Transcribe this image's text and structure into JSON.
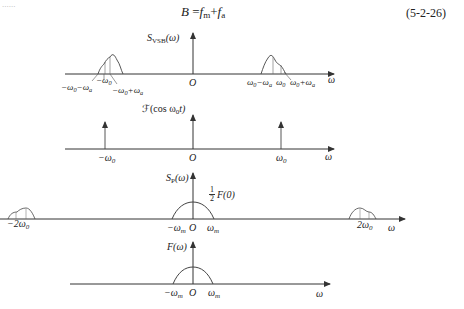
{
  "header": {
    "top_fragment": "......",
    "equation": "B = f_m + f_a",
    "equation_parts": {
      "lhs": "B",
      "eq": "=",
      "t1": "f",
      "t1_sub": "m",
      "plus": "+",
      "t2": "f",
      "t2_sub": "a"
    },
    "equation_number": "(5-2-26)"
  },
  "panels": [
    {
      "id": "vsb",
      "y_label": "S",
      "y_label_sub": "VSB",
      "y_label_arg": "(ω)",
      "origin": "O",
      "x_label": "ω",
      "ticks_left": {
        "a": "−ω",
        "a_sub": "0",
        "a2": "−ω",
        "a2_sub": "a",
        "b": "−ω",
        "b_sub": "0",
        "c": "−ω",
        "c_sub": "0",
        "c2": "+ω",
        "c2_sub": "a"
      },
      "ticks_right": {
        "a": "ω",
        "a_sub": "0",
        "a2": "−ω",
        "a2_sub": "a",
        "b": "ω",
        "b_sub": "0",
        "c": "ω",
        "c_sub": "0",
        "c2": "+ω",
        "c2_sub": "a"
      }
    },
    {
      "id": "carrier",
      "y_label": "ℱ(cos ω",
      "y_label_sub": "0",
      "y_label_arg": "t)",
      "origin": "O",
      "x_label": "ω",
      "tick_left": "−ω",
      "tick_left_sub": "0",
      "tick_right": "ω",
      "tick_right_sub": "0"
    },
    {
      "id": "product",
      "y_label": "S",
      "y_label_sub": "P",
      "y_label_arg": "(ω)",
      "peak_label_num": "1",
      "peak_label_den": "2",
      "peak_label": "F(0)",
      "origin": "O",
      "x_label": "ω",
      "tick_neg_m": "−ω",
      "tick_neg_m_sub": "m",
      "tick_pos_m": "ω",
      "tick_pos_m_sub": "m",
      "tick_neg_2w0": "−2ω",
      "tick_neg_2w0_sub": "0",
      "tick_pos_2w0": "2ω",
      "tick_pos_2w0_sub": "0"
    },
    {
      "id": "baseband",
      "y_label": "F(ω)",
      "origin": "O",
      "x_label": "ω",
      "tick_neg_m": "−ω",
      "tick_neg_m_sub": "m",
      "tick_pos_m": "ω",
      "tick_pos_m_sub": "m"
    }
  ],
  "colors": {
    "line": "#333333",
    "curve": "#444444",
    "background": "#ffffff"
  }
}
